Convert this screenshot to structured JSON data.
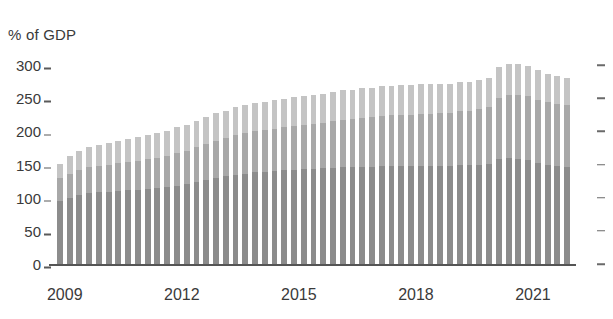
{
  "chart_data": {
    "type": "bar",
    "title": "",
    "subtitle": "",
    "ylabel": "% of GDP",
    "xlabel": "",
    "ylim": [
      0,
      300
    ],
    "ytick_values": [
      0,
      50,
      100,
      150,
      200,
      250,
      300
    ],
    "ytick_labels": [
      "0",
      "50",
      "100",
      "150",
      "200",
      "250",
      "300"
    ],
    "xtick_labels": [
      "2009",
      "2012",
      "2015",
      "2018",
      "2021"
    ],
    "xtick_positions": [
      0.5,
      12.5,
      24.5,
      36.5,
      48.5
    ],
    "grid": false,
    "legend": "none",
    "stacked": true,
    "right_axis_ticks": true,
    "colors": {
      "series_0": "#8c8c8c",
      "series_1": "#a8a8a8",
      "series_2": "#c4c4c4",
      "axis": "#555555",
      "text": "#3a3a3a",
      "background": "#ffffff"
    },
    "categories": [
      "2009 Q1",
      "2009 Q2",
      "2009 Q3",
      "2009 Q4",
      "2010 Q1",
      "2010 Q2",
      "2010 Q3",
      "2010 Q4",
      "2011 Q1",
      "2011 Q2",
      "2011 Q3",
      "2011 Q4",
      "2012 Q1",
      "2012 Q2",
      "2012 Q3",
      "2012 Q4",
      "2013 Q1",
      "2013 Q2",
      "2013 Q3",
      "2013 Q4",
      "2014 Q1",
      "2014 Q2",
      "2014 Q3",
      "2014 Q4",
      "2015 Q1",
      "2015 Q2",
      "2015 Q3",
      "2015 Q4",
      "2016 Q1",
      "2016 Q2",
      "2016 Q3",
      "2016 Q4",
      "2017 Q1",
      "2017 Q2",
      "2017 Q3",
      "2017 Q4",
      "2018 Q1",
      "2018 Q2",
      "2018 Q3",
      "2018 Q4",
      "2019 Q1",
      "2019 Q2",
      "2019 Q3",
      "2019 Q4",
      "2020 Q1",
      "2020 Q2",
      "2020 Q3",
      "2020 Q4",
      "2021 Q1",
      "2021 Q2",
      "2021 Q3",
      "2021 Q4",
      "2022 Q1"
    ],
    "series": [
      {
        "name": "series_0",
        "values": [
          95,
          100,
          104,
          107,
          108,
          109,
          110,
          111,
          112,
          113,
          114,
          116,
          118,
          121,
          124,
          127,
          130,
          132,
          134,
          136,
          138,
          139,
          140,
          141,
          142,
          143,
          143,
          144,
          145,
          146,
          146,
          147,
          147,
          148,
          148,
          148,
          148,
          148,
          148,
          148,
          148,
          149,
          149,
          150,
          151,
          158,
          160,
          159,
          157,
          153,
          150,
          148,
          147
        ]
      },
      {
        "name": "series_1",
        "values": [
          34,
          36,
          38,
          39,
          40,
          41,
          42,
          43,
          44,
          45,
          46,
          47,
          49,
          50,
          52,
          54,
          56,
          58,
          60,
          61,
          62,
          63,
          64,
          65,
          66,
          67,
          68,
          69,
          70,
          71,
          72,
          73,
          74,
          75,
          76,
          77,
          77,
          78,
          78,
          79,
          80,
          81,
          82,
          83,
          85,
          92,
          95,
          96,
          96,
          95,
          94,
          93,
          92
        ]
      },
      {
        "name": "series_2",
        "values": [
          22,
          27,
          29,
          31,
          32,
          33,
          34,
          35,
          36,
          36,
          37,
          38,
          39,
          39,
          40,
          40,
          41,
          41,
          42,
          42,
          42,
          43,
          43,
          43,
          44,
          44,
          44,
          44,
          45,
          45,
          45,
          45,
          45,
          45,
          45,
          45,
          45,
          45,
          45,
          45,
          44,
          44,
          44,
          44,
          45,
          47,
          47,
          46,
          45,
          44,
          43,
          42,
          41
        ]
      }
    ],
    "totals": [
      151,
      163,
      171,
      177,
      180,
      183,
      186,
      189,
      192,
      194,
      197,
      201,
      206,
      210,
      216,
      221,
      227,
      231,
      236,
      239,
      242,
      245,
      247,
      249,
      252,
      254,
      255,
      257,
      260,
      262,
      263,
      265,
      266,
      268,
      269,
      270,
      270,
      271,
      271,
      272,
      272,
      274,
      275,
      277,
      281,
      297,
      302,
      301,
      298,
      292,
      287,
      283,
      280
    ]
  }
}
